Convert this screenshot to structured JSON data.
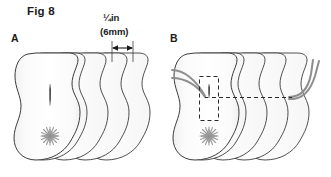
{
  "figure": {
    "title": "Fig 8",
    "panels": [
      {
        "id": "A",
        "label": "A",
        "description": "stack of five fabric layers with a cut slit and a gathered starburst mark",
        "layer_count": 5,
        "layer_offset_px": 21,
        "marks": [
          "vertical-slit",
          "starburst"
        ]
      },
      {
        "id": "B",
        "label": "B",
        "description": "same stack with cord threaded through the slit, dashed detail box and dash-dot centerline",
        "layer_count": 5,
        "layer_offset_px": 21,
        "marks": [
          "cord",
          "dashed-detail-box",
          "dash-dot-centerline",
          "starburst"
        ]
      }
    ]
  },
  "dimension": {
    "imperial": "¼in",
    "metric": "(6mm)",
    "arrow": "double-headed",
    "span_px": 21
  },
  "colors": {
    "outline": "#3c3c3c",
    "fill_light": "#fdfdfd",
    "fill_shade": "#f1f1f1",
    "cord": "#8e8e8e",
    "mark_dark": "#2b2b2b",
    "mark_gray": "#9a9a9a",
    "text": "#1a1a1a",
    "background": "#ffffff"
  }
}
